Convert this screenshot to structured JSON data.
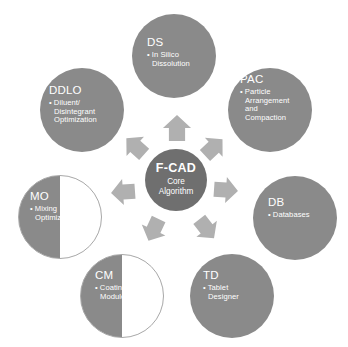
{
  "diagram": {
    "type": "hub-and-spoke",
    "background_color": "#ffffff",
    "node_color": "#8a8a8a",
    "center_color": "#6f6f6f",
    "arrow_color": "#b0b0b0",
    "outline_color": "#a8a8a8",
    "label_color": "#ffffff"
  },
  "center": {
    "title": "F-CAD",
    "subtitle_line1": "Core",
    "subtitle_line2": "Algorithm"
  },
  "nodes": [
    {
      "id": "ds",
      "title": "DS",
      "desc_lines": [
        "• In Silico",
        "Dissolution"
      ],
      "fill": "full",
      "position": "top"
    },
    {
      "id": "pac",
      "title": "PAC",
      "desc_lines": [
        "• Particle",
        "Arrangement",
        "and",
        "Compaction"
      ],
      "fill": "full",
      "position": "top-right"
    },
    {
      "id": "db",
      "title": "DB",
      "desc_lines": [
        "• Databases"
      ],
      "fill": "full",
      "position": "right"
    },
    {
      "id": "td",
      "title": "TD",
      "desc_lines": [
        "• Tablet",
        "Designer"
      ],
      "fill": "full",
      "position": "bottom-right"
    },
    {
      "id": "cm",
      "title": "CM",
      "desc_lines": [
        "• Coating",
        "Module"
      ],
      "fill": "half",
      "position": "bottom-left"
    },
    {
      "id": "mo",
      "title": "MO",
      "desc_lines": [
        "• Mixing",
        "Optimization"
      ],
      "fill": "half",
      "position": "left"
    },
    {
      "id": "ddlo",
      "title": "DDLO",
      "desc_lines": [
        "• Diluent/",
        "Disintegrant",
        "Optimization"
      ],
      "fill": "full",
      "position": "top-left"
    }
  ],
  "arrows": [
    {
      "id": "arrow-to-ds",
      "target": "ds",
      "direction": "up"
    },
    {
      "id": "arrow-to-pac",
      "target": "pac",
      "direction": "up-right"
    },
    {
      "id": "arrow-to-db",
      "target": "db",
      "direction": "right"
    },
    {
      "id": "arrow-to-td",
      "target": "td",
      "direction": "down-right"
    },
    {
      "id": "arrow-to-cm",
      "target": "cm",
      "direction": "down-left"
    },
    {
      "id": "arrow-to-mo",
      "target": "mo",
      "direction": "left"
    },
    {
      "id": "arrow-to-ddlo",
      "target": "ddlo",
      "direction": "up-left"
    }
  ]
}
